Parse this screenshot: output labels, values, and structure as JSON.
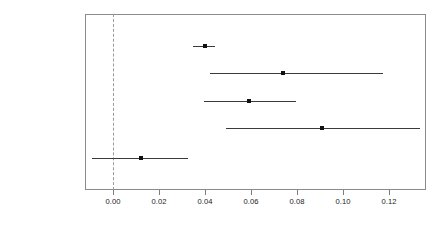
{
  "chart_data": {
    "type": "scatter",
    "title": "",
    "subtitle": "",
    "xlabel": "",
    "ylabel": "",
    "orientation": "horizontal",
    "plot_style": "coefficient-plot-with-confidence-intervals",
    "grid": false,
    "legend": null,
    "xlim": [
      -0.0122,
      0.1361
    ],
    "xticks": [
      0.0,
      0.02,
      0.04,
      0.06,
      0.08,
      0.1,
      0.12
    ],
    "xtick_labels": [
      "0.00",
      "0.02",
      "0.04",
      "0.06",
      "0.08",
      "0.10",
      "0.12"
    ],
    "reference_line": {
      "value": 0.0,
      "style": "dashed",
      "color": "#9a9a9a",
      "orientation": "vertical"
    },
    "categories": [
      "No obvious directivity",
      "Enterprise",
      "Individual/Family",
      "Social coordination",
      "Government/Party"
    ],
    "values": [
      0.04,
      0.074,
      0.059,
      0.091,
      0.012
    ],
    "ci_low": [
      0.0348,
      0.0422,
      0.0396,
      0.0491,
      -0.0091
    ],
    "ci_high": [
      0.0444,
      0.1174,
      0.0796,
      0.1335,
      0.0326
    ],
    "points": [
      {
        "label": "No obvious directivity",
        "estimate": 0.04,
        "ci_low": 0.0348,
        "ci_high": 0.0444
      },
      {
        "label": "Enterprise",
        "estimate": 0.074,
        "ci_low": 0.0422,
        "ci_high": 0.1174
      },
      {
        "label": "Individual/Family",
        "estimate": 0.059,
        "ci_low": 0.0396,
        "ci_high": 0.0796
      },
      {
        "label": "Social coordination",
        "estimate": 0.091,
        "ci_low": 0.0491,
        "ci_high": 0.1335
      },
      {
        "label": "Government/Party",
        "estimate": 0.012,
        "ci_low": -0.0091,
        "ci_high": 0.0326
      }
    ],
    "colors": {
      "point": "#111111",
      "line": "#3a3a3a",
      "panel_border": "#8a8a8a",
      "reference_line": "#9a9a9a",
      "text": "#1a1a1a",
      "background": "#ffffff"
    }
  }
}
